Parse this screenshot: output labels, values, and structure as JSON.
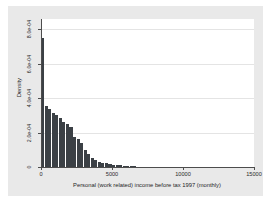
{
  "chart_data": {
    "type": "bar",
    "title": "",
    "subtitle": "",
    "xlabel": "Personal (work related) income before tax 1997 (monthly)",
    "ylabel": "Density",
    "xlim": [
      0,
      15000
    ],
    "ylim": [
      0,
      0.00086
    ],
    "grid": true,
    "legend": null,
    "bin_width": 250,
    "bar_color": "#3b4045",
    "x_ticks": [
      0,
      5000,
      10000,
      15000
    ],
    "x_tick_labels": [
      "0",
      "5000",
      "10000",
      "15000"
    ],
    "y_ticks": [
      0,
      0.0002,
      0.0004,
      0.0006,
      0.0008
    ],
    "y_tick_labels": [
      "0",
      "2.0e-04",
      "4.0e-04",
      "6.0e-04",
      "8.0e-04"
    ],
    "categories": [
      125,
      375,
      625,
      875,
      1125,
      1375,
      1625,
      1875,
      2125,
      2375,
      2625,
      2875,
      3125,
      3375,
      3625,
      3875,
      4125,
      4375,
      4625,
      4875,
      5125,
      5375,
      5625,
      5875,
      6125,
      6375,
      6625,
      6875,
      7125,
      7375,
      7625,
      7875,
      8125,
      8375,
      8625,
      8875,
      9125,
      9375,
      9625,
      9875,
      10125,
      10375,
      10625,
      10875,
      11125,
      11375,
      11625,
      11875,
      12125,
      12375,
      12625,
      12875,
      13125,
      13375,
      13625,
      13875,
      14125,
      14375,
      14625,
      14875
    ],
    "values": [
      0.00075,
      0.000355,
      0.000335,
      0.000315,
      0.0003,
      0.000285,
      0.00026,
      0.00025,
      0.00023,
      0.000175,
      0.00016,
      0.00014,
      0.0001,
      7.5e-05,
      5.5e-05,
      4.2e-05,
      3.2e-05,
      2.6e-05,
      2.2e-05,
      1.9e-05,
      1.4e-05,
      1.2e-05,
      9e-06,
      7e-06,
      5e-06,
      4e-06,
      3e-06,
      2.6e-06,
      2.2e-06,
      2e-06,
      1.8e-06,
      1.6e-06,
      1.5e-06,
      1.4e-06,
      1.3e-06,
      1.2e-06,
      1.1e-06,
      1e-06,
      9.5e-07,
      9e-07,
      8.5e-07,
      8e-07,
      7.5e-07,
      7e-07,
      6.5e-07,
      6e-07,
      5.5e-07,
      5e-07,
      4.5e-07,
      4e-07,
      3.5e-07,
      3e-07,
      2.8e-07,
      2.6e-07,
      2.4e-07,
      2.2e-07,
      2e-07,
      1.8e-07,
      1.6e-07,
      1.4e-07
    ]
  }
}
